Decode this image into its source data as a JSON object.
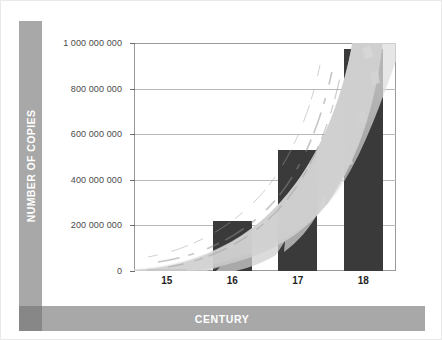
{
  "axes": {
    "y_title": "NUMBER OF COPIES",
    "x_title": "CENTURY"
  },
  "colors": {
    "bar": "#3a3a3a",
    "band": "#a8a8a8",
    "band_corner": "#878787",
    "brush": "#cfcfcf",
    "grid": "#b9b9b9",
    "frame": "#9a9a9a",
    "page": "#ffffff"
  },
  "chart_data": {
    "type": "bar",
    "title": "",
    "xlabel": "CENTURY",
    "ylabel": "NUMBER OF COPIES",
    "categories": [
      "15",
      "16",
      "17",
      "18"
    ],
    "values": [
      10000000,
      220000000,
      530000000,
      975000000
    ],
    "ylim": [
      0,
      1000000000
    ],
    "yticks": [
      0,
      200000000,
      400000000,
      600000000,
      800000000,
      1000000000
    ],
    "ytick_labels": [
      "0",
      "200 000 000",
      "400 000 000",
      "600 000 000",
      "800 000 000",
      "1 000 000 000"
    ],
    "grid": true,
    "legend": "none",
    "annotations": [
      {
        "name": "exponential-brush-stroke",
        "description": "light grey painted brush-stroke curve sweeping exponentially upward from left baseline across the bars"
      }
    ]
  }
}
